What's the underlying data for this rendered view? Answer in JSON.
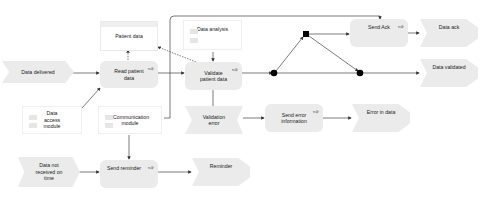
{
  "nodes": {
    "data_delivered": "Data delivered",
    "read_patient_data": "Read patient data",
    "patient_data": "Patient data",
    "data_access_module": "Data access module",
    "communication_module": "Communication module",
    "data_not_received": "Data not received on time",
    "send_reminder": "Send reminder",
    "reminder": "Reminder",
    "data_analysis": "Data analysis",
    "validate_patient_data": "Validate patient data",
    "validation_error": "Validation error",
    "send_error_information": "Send error information",
    "error_in_data": "Error in data",
    "send_ack": "Send Ack",
    "data_ack": "Data ack",
    "data_validated": "Data validated"
  },
  "icons": {
    "process_arrow": "⇨"
  },
  "colors": {
    "node_fill": "#ebebeb",
    "line": "#333333",
    "connector": "#000000"
  }
}
